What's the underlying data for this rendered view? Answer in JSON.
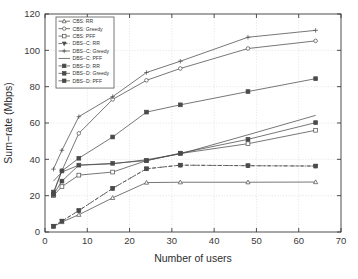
{
  "chart_data": {
    "type": "line",
    "title": "",
    "xlabel": "Number of users",
    "ylabel": "Sum−rate (Mbps)",
    "xlim": [
      0,
      70
    ],
    "ylim": [
      0,
      120
    ],
    "xticks": [
      0,
      10,
      20,
      30,
      40,
      50,
      60,
      70
    ],
    "yticks": [
      0,
      20,
      40,
      60,
      80,
      100,
      120
    ],
    "grid": true,
    "legend_position": "upper-left",
    "x": [
      2,
      4,
      8,
      16,
      24,
      32,
      48,
      64
    ],
    "series": [
      {
        "name": "CBS: RR",
        "marker": "triangle-up",
        "linestyle": "solid",
        "values": [
          3.0,
          5.5,
          9.5,
          18.8,
          27.2,
          27.4,
          27.4,
          27.5
        ]
      },
      {
        "name": "CBS: Greedy",
        "marker": "circle",
        "linestyle": "solid",
        "values": [
          21.0,
          33.8,
          54.3,
          73.0,
          83.5,
          90.0,
          101.0,
          105.2
        ]
      },
      {
        "name": "CBS: PFF",
        "marker": "square",
        "linestyle": "solid",
        "values": [
          20.0,
          25.0,
          31.3,
          33.0,
          39.3,
          43.2,
          48.6,
          56.0
        ]
      },
      {
        "name": "DBS−C: RR",
        "marker": "triangle-down",
        "linestyle": "dashed",
        "values": [
          3.2,
          6.0,
          11.8,
          24.0,
          34.8,
          36.8,
          36.5,
          36.3
        ]
      },
      {
        "name": "DBS−C: Greedy",
        "marker": "plus",
        "linestyle": "solid",
        "values": [
          34.6,
          45.0,
          63.5,
          74.5,
          87.8,
          94.0,
          107.2,
          111.0
        ]
      },
      {
        "name": "DBS−C: PFF",
        "marker": "none",
        "linestyle": "solid",
        "values": [
          28.0,
          33.0,
          36.8,
          37.5,
          39.8,
          43.0,
          53.5,
          64.2
        ]
      },
      {
        "name": "DBS−D: RR",
        "marker": "square-filled",
        "linestyle": "dashdot",
        "values": [
          3.2,
          6.0,
          11.8,
          24.0,
          34.8,
          36.8,
          36.5,
          36.3
        ]
      },
      {
        "name": "DBS−D: Greedy",
        "marker": "square-filled",
        "linestyle": "solid",
        "values": [
          22.0,
          33.6,
          40.6,
          52.3,
          66.0,
          70.0,
          77.3,
          84.4
        ]
      },
      {
        "name": "DBS−D: PFF",
        "marker": "square-filled",
        "linestyle": "solid",
        "values": [
          20.6,
          28.0,
          36.8,
          37.8,
          39.3,
          43.4,
          51.0,
          60.2
        ]
      }
    ]
  },
  "axes": {
    "xlabel": "Number of users",
    "ylabel": "Sum−rate (Mbps)",
    "xticklabels": [
      "0",
      "10",
      "20",
      "30",
      "40",
      "50",
      "60",
      "70"
    ],
    "yticklabels": [
      "0",
      "20",
      "40",
      "60",
      "80",
      "100",
      "120"
    ]
  },
  "legend": {
    "items": [
      {
        "label": "CBS: RR"
      },
      {
        "label": "CBS: Greedy"
      },
      {
        "label": "CBS: PFF"
      },
      {
        "label": "DBS−C: RR"
      },
      {
        "label": "DBS−C: Greedy"
      },
      {
        "label": "DBS−C: PFF"
      },
      {
        "label": "DBS−D: RR"
      },
      {
        "label": "DBS−D: Greedy"
      },
      {
        "label": "DBS−D: PFF"
      }
    ]
  },
  "colors": {
    "line": "#4a4a4a",
    "axis": "#3b3b3b",
    "grid": "#d8d8d8",
    "background": "#ffffff"
  }
}
